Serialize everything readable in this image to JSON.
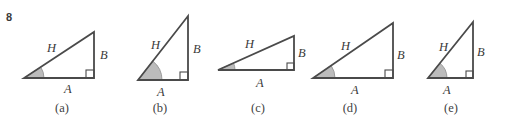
{
  "problem": {
    "number": "8"
  },
  "style": {
    "stroke_color": "#4a4a4a",
    "angle_fill_color": "#bcbcbc",
    "angle_stroke_color": "#8d8d8d",
    "background_color": "#ffffff",
    "text_color": "#3a3a3a",
    "stroke_width": 1.8
  },
  "figure": {
    "type": "right-triangle-set",
    "common_labels": {
      "hypotenuse": "H",
      "vertical_leg": "B",
      "horizontal_leg": "A"
    },
    "triangles": [
      {
        "id": "a",
        "caption": "(a)",
        "left": 14,
        "width": 96,
        "vertices": {
          "angle_vertex": [
            10,
            78
          ],
          "right_angle_vertex": [
            80,
            78
          ],
          "apex": [
            80,
            32
          ]
        },
        "arc_radius": 20,
        "right_marker_size": 8,
        "labels": {
          "H": "H",
          "B": "B",
          "A": "A"
        },
        "label_positions": {
          "H": [
            33,
            41
          ],
          "B": [
            86,
            48
          ],
          "A": [
            50,
            82
          ]
        }
      },
      {
        "id": "b",
        "caption": "(b)",
        "left": 113,
        "width": 94,
        "vertices": {
          "angle_vertex": [
            25,
            80
          ],
          "right_angle_vertex": [
            75,
            80
          ],
          "apex": [
            75,
            16
          ]
        },
        "arc_radius": 24,
        "right_marker_size": 8,
        "labels": {
          "H": "H",
          "B": "B",
          "A": "A"
        },
        "label_positions": {
          "H": [
            38,
            38
          ],
          "B": [
            80,
            42
          ],
          "A": [
            44,
            85
          ]
        }
      },
      {
        "id": "c",
        "caption": "(c)",
        "left": 210,
        "width": 96,
        "vertices": {
          "angle_vertex": [
            8,
            70
          ],
          "right_angle_vertex": [
            84,
            70
          ],
          "apex": [
            84,
            36
          ]
        },
        "arc_radius": 17,
        "right_marker_size": 7,
        "labels": {
          "H": "H",
          "B": "B",
          "A": "A"
        },
        "label_positions": {
          "H": [
            35,
            37
          ],
          "B": [
            88,
            46
          ],
          "A": [
            46,
            76
          ]
        }
      },
      {
        "id": "d",
        "caption": "(d)",
        "left": 300,
        "width": 100,
        "vertices": {
          "angle_vertex": [
            13,
            78
          ],
          "right_angle_vertex": [
            93,
            78
          ],
          "apex": [
            93,
            23
          ]
        },
        "arc_radius": 22,
        "right_marker_size": 8,
        "labels": {
          "H": "H",
          "B": "B",
          "A": "A"
        },
        "label_positions": {
          "H": [
            41,
            39
          ],
          "B": [
            97,
            48
          ],
          "A": [
            51,
            83
          ]
        }
      },
      {
        "id": "e",
        "caption": "(e)",
        "left": 405,
        "width": 92,
        "vertices": {
          "angle_vertex": [
            23,
            78
          ],
          "right_angle_vertex": [
            68,
            78
          ],
          "apex": [
            68,
            22
          ]
        },
        "arc_radius": 19,
        "right_marker_size": 7,
        "labels": {
          "H": "H",
          "B": "B",
          "A": "A"
        },
        "label_positions": {
          "H": [
            34,
            40
          ],
          "B": [
            72,
            45
          ],
          "A": [
            38,
            83
          ]
        }
      }
    ]
  }
}
